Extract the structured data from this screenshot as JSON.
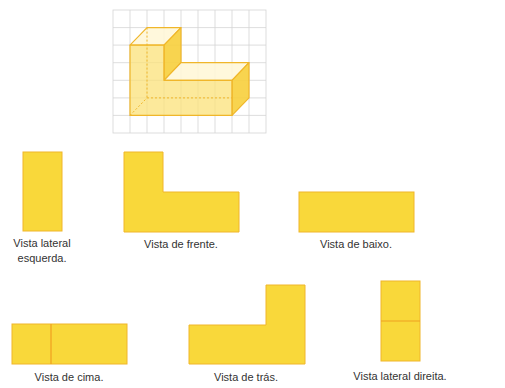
{
  "colors": {
    "fill": "#F9D83A",
    "stroke": "#F0B62A",
    "face_front": "#FBE27A",
    "face_side": "#F7CF3C",
    "face_top": "#FFF7D6",
    "grid": "#D4D4D4",
    "text": "#333333"
  },
  "figure": {
    "grid": {
      "cols": 9,
      "rows": 7
    }
  },
  "views": {
    "left": {
      "line1": "Vista lateral",
      "line2": "esquerda."
    },
    "front": {
      "label": "Vista de frente."
    },
    "bottom": {
      "label": "Vista de baixo."
    },
    "top": {
      "label": "Vista de cima."
    },
    "back": {
      "label": "Vista de trás."
    },
    "right": {
      "label": "Vista lateral direita."
    }
  }
}
